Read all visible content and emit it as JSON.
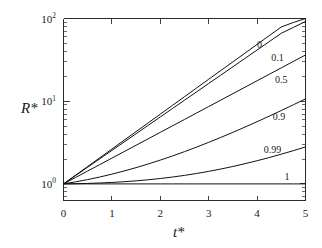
{
  "chart_data": {
    "type": "line",
    "title": "",
    "xlabel": "t*",
    "ylabel": "R*",
    "xlim": [
      0,
      5
    ],
    "ylim": [
      0.63,
      100
    ],
    "yscale": "log",
    "xscale": "linear",
    "grid": false,
    "legend_position": "inline-right-of-curves",
    "x_ticks": [
      "0",
      "1",
      "2",
      "3",
      "4",
      "5"
    ],
    "x_tick_values": [
      0,
      1,
      2,
      3,
      4,
      5
    ],
    "y_ticks": [
      "10⁰",
      "10¹",
      "10²"
    ],
    "y_tick_bases": [
      "10",
      "10",
      "10"
    ],
    "y_tick_exponents": [
      "0",
      "1",
      "2"
    ],
    "y_tick_values": [
      1,
      10,
      100
    ],
    "x": [
      0,
      0.25,
      0.5,
      0.75,
      1,
      1.25,
      1.5,
      1.75,
      2,
      2.25,
      2.5,
      2.75,
      3,
      3.25,
      3.5,
      3.75,
      4,
      4.25,
      4.5,
      4.75,
      5
    ],
    "series": [
      {
        "name": "0",
        "label": "0",
        "label_x": 4.05,
        "label_y": 49.0,
        "values": [
          1.0,
          1.275,
          1.625,
          2.07,
          2.64,
          3.37,
          4.29,
          5.47,
          6.97,
          8.89,
          11.33,
          14.45,
          18.42,
          23.48,
          29.93,
          38.15,
          48.63,
          61.99,
          79.02,
          89.5,
          100.0
        ]
      },
      {
        "name": "0.1",
        "label": "0.1",
        "label_x": 4.42,
        "label_y": 33.5,
        "values": [
          1.0,
          1.262,
          1.593,
          2.011,
          2.539,
          3.205,
          4.046,
          5.108,
          6.449,
          8.142,
          10.28,
          12.97,
          16.38,
          20.68,
          26.1,
          32.95,
          41.6,
          52.52,
          66.3,
          78.0,
          92.0
        ]
      },
      {
        "name": "0.5",
        "label": "0.5",
        "label_x": 4.5,
        "label_y": 18.2,
        "values": [
          1.0,
          1.196,
          1.432,
          1.713,
          2.05,
          2.453,
          2.935,
          3.512,
          4.203,
          5.029,
          6.018,
          7.201,
          8.617,
          10.31,
          12.34,
          14.77,
          17.67,
          21.15,
          25.3,
          30.3,
          36.2
        ]
      },
      {
        "name": "0.9",
        "label": "0.9",
        "label_x": 4.45,
        "label_y": 6.55,
        "values": [
          1.0,
          1.058,
          1.128,
          1.212,
          1.312,
          1.432,
          1.573,
          1.741,
          1.94,
          2.176,
          2.455,
          2.787,
          3.18,
          3.648,
          4.204,
          4.866,
          5.654,
          6.593,
          7.715,
          9.057,
          10.67
        ]
      },
      {
        "name": "0.99",
        "label": "0.99",
        "label_x": 4.32,
        "label_y": 2.62,
        "values": [
          1.0,
          1.006,
          1.014,
          1.026,
          1.042,
          1.063,
          1.089,
          1.122,
          1.162,
          1.21,
          1.268,
          1.337,
          1.418,
          1.513,
          1.625,
          1.755,
          1.907,
          2.083,
          2.288,
          2.525,
          2.8
        ]
      },
      {
        "name": "1",
        "label": "1",
        "label_x": 4.62,
        "label_y": 1.22,
        "values": [
          1.0,
          1.0,
          1.0,
          1.0,
          1.0,
          1.0,
          1.0,
          1.0,
          1.0,
          1.0,
          1.0,
          1.0,
          1.0,
          1.0,
          1.0,
          1.0,
          1.0,
          1.0,
          1.0,
          1.0,
          1.0
        ]
      }
    ]
  },
  "figure": {
    "background_color": "#ffffff",
    "line_color": "#111111",
    "axis_color": "#2b2b2b"
  }
}
